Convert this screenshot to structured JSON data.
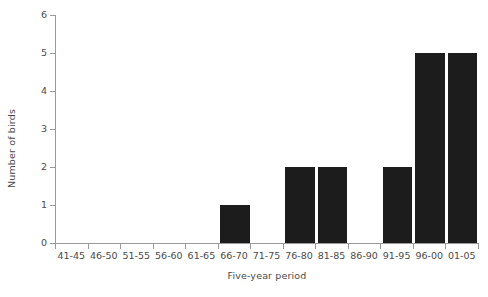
{
  "chart_data": {
    "type": "bar",
    "title": "",
    "xlabel": "Five-year period",
    "ylabel": "Number of birds",
    "categories": [
      "41-45",
      "46-50",
      "51-55",
      "56-60",
      "61-65",
      "66-70",
      "71-75",
      "76-80",
      "81-85",
      "86-90",
      "91-95",
      "96-00",
      "01-05"
    ],
    "values": [
      0,
      0,
      0,
      0,
      0,
      1,
      0,
      2,
      2,
      0,
      2,
      5,
      5
    ],
    "ylim": [
      0,
      6
    ],
    "yticks": [
      "0",
      "1",
      "2",
      "3",
      "4",
      "5",
      "6"
    ],
    "grid": false,
    "legend": null,
    "bar_color": "#1c1c1c",
    "axis_color": "#9a9a9a",
    "text_color": "#4a4a4a",
    "background": "#ffffff"
  }
}
